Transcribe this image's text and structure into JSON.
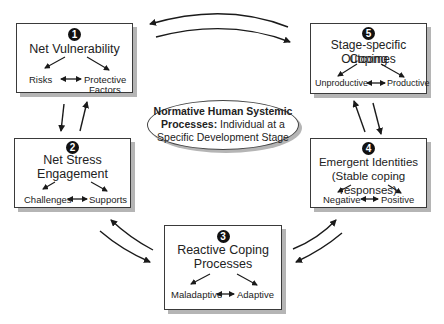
{
  "center": {
    "bold": "Normative Human Systemic Processes:",
    "bold_line1": "Normative Human Systemic",
    "bold_line2": "Processes:",
    "rest_line2": " Individual at a",
    "line3": "Specific Development Stage"
  },
  "boxes": [
    {
      "number": "1",
      "title_lines": [
        "Net Vulnerability"
      ],
      "left": "Risks",
      "right_lines": [
        "Protective",
        "Factors"
      ]
    },
    {
      "number": "2",
      "title_lines": [
        "Net Stress",
        "Engagement"
      ],
      "left": "Challenges",
      "right_lines": [
        "Supports"
      ]
    },
    {
      "number": "3",
      "title_lines": [
        "Reactive Coping",
        "Processes"
      ],
      "left": "Maladaptive",
      "right_lines": [
        "Adaptive"
      ]
    },
    {
      "number": "4",
      "title_lines": [
        "Emergent Identities",
        "(Stable coping responses)"
      ],
      "left": "Negative",
      "right_lines": [
        "Positive"
      ]
    },
    {
      "number": "5",
      "title_lines": [
        "Stage-specific Coping",
        "Outcomes"
      ],
      "left": "Unproductive",
      "right_lines": [
        "Productive"
      ]
    }
  ],
  "colors": {
    "stroke": "#1a1a1a",
    "shadow": "#b5b5b5"
  }
}
